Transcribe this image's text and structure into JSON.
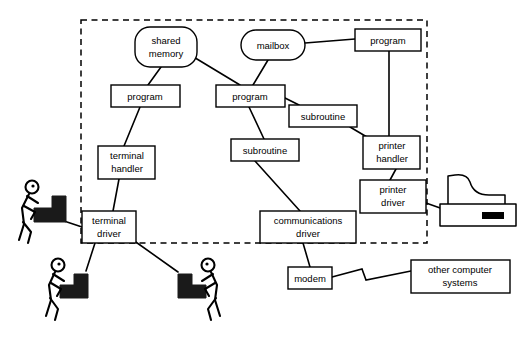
{
  "diagram": {
    "boundary": {
      "label": "computer-system-boundary",
      "style": "dashed"
    },
    "nodes": [
      {
        "id": "shared_memory",
        "label": "shared memory",
        "shape": "rounded-rect",
        "x": 135,
        "y": 27,
        "w": 62,
        "h": 40
      },
      {
        "id": "mailbox",
        "label": "mailbox",
        "shape": "pill",
        "x": 241,
        "y": 30,
        "w": 64,
        "h": 30
      },
      {
        "id": "program_right",
        "label": "program",
        "shape": "rect",
        "x": 355,
        "y": 29,
        "w": 66,
        "h": 22
      },
      {
        "id": "program_left",
        "label": "program",
        "shape": "rect",
        "x": 111,
        "y": 85,
        "w": 69,
        "h": 22
      },
      {
        "id": "program_mid",
        "label": "program",
        "shape": "rect",
        "x": 216,
        "y": 85,
        "w": 69,
        "h": 22
      },
      {
        "id": "subroutine_upper",
        "label": "subroutine",
        "shape": "rect",
        "x": 289,
        "y": 105,
        "w": 68,
        "h": 22
      },
      {
        "id": "subroutine_lower",
        "label": "subroutine",
        "shape": "rect",
        "x": 231,
        "y": 139,
        "w": 68,
        "h": 22
      },
      {
        "id": "terminal_handler",
        "label": "terminal handler",
        "shape": "rect",
        "x": 98,
        "y": 146,
        "w": 57,
        "h": 33
      },
      {
        "id": "printer_handler",
        "label": "printer handler",
        "shape": "rect",
        "x": 363,
        "y": 136,
        "w": 57,
        "h": 33
      },
      {
        "id": "printer_driver",
        "label": "printer driver",
        "shape": "rect",
        "x": 360,
        "y": 180,
        "w": 66,
        "h": 33
      },
      {
        "id": "terminal_driver",
        "label": "terminal driver",
        "shape": "rect",
        "x": 82,
        "y": 211,
        "w": 54,
        "h": 32
      },
      {
        "id": "comms_driver",
        "label": "communications driver",
        "shape": "rect",
        "x": 260,
        "y": 211,
        "w": 96,
        "h": 32
      },
      {
        "id": "modem",
        "label": "modem",
        "shape": "rect",
        "x": 288,
        "y": 267,
        "w": 44,
        "h": 22
      },
      {
        "id": "other_systems",
        "label": "other computer systems",
        "shape": "rect",
        "x": 411,
        "y": 260,
        "w": 99,
        "h": 33
      }
    ],
    "edges": [
      {
        "from": "shared_memory",
        "to": "program_left",
        "kind": "line"
      },
      {
        "from": "shared_memory",
        "to": "program_mid",
        "kind": "line"
      },
      {
        "from": "mailbox",
        "to": "program_mid",
        "kind": "line"
      },
      {
        "from": "mailbox",
        "to": "program_right",
        "kind": "line"
      },
      {
        "from": "program_right",
        "to": "printer_handler",
        "kind": "line"
      },
      {
        "from": "program_left",
        "to": "terminal_handler",
        "kind": "line"
      },
      {
        "from": "program_mid",
        "to": "subroutine_upper",
        "kind": "line"
      },
      {
        "from": "program_mid",
        "to": "subroutine_lower",
        "kind": "line"
      },
      {
        "from": "subroutine_upper",
        "to": "printer_handler",
        "kind": "line"
      },
      {
        "from": "subroutine_lower",
        "to": "comms_driver",
        "kind": "line"
      },
      {
        "from": "terminal_handler",
        "to": "terminal_driver",
        "kind": "line"
      },
      {
        "from": "printer_handler",
        "to": "printer_driver",
        "kind": "line"
      },
      {
        "from": "printer_driver",
        "to": "printer",
        "kind": "line"
      },
      {
        "from": "terminal_driver",
        "to": "terminal_1",
        "kind": "line"
      },
      {
        "from": "terminal_driver",
        "to": "terminal_2",
        "kind": "line"
      },
      {
        "from": "terminal_driver",
        "to": "terminal_3",
        "kind": "line"
      },
      {
        "from": "comms_driver",
        "to": "modem",
        "kind": "line"
      },
      {
        "from": "modem",
        "to": "other_systems",
        "kind": "zigzag"
      }
    ],
    "devices": [
      {
        "id": "terminal_1",
        "name": "user-at-terminal",
        "facing": "right"
      },
      {
        "id": "terminal_2",
        "name": "user-at-terminal",
        "facing": "right"
      },
      {
        "id": "terminal_3",
        "name": "user-at-terminal",
        "facing": "left"
      },
      {
        "id": "printer",
        "name": "printer"
      }
    ]
  }
}
